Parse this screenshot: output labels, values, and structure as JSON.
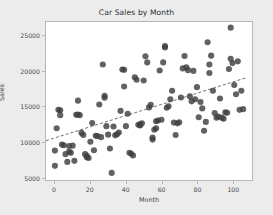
{
  "chart_data": {
    "type": "scatter",
    "title": "Car Sales by Month",
    "xlabel": "Month",
    "ylabel": "Sales",
    "xlim": [
      -5,
      111
    ],
    "ylim": [
      4600,
      26900
    ],
    "xticks": [
      0,
      20,
      40,
      60,
      80,
      100
    ],
    "yticks": [
      5000,
      10000,
      15000,
      20000,
      25000
    ],
    "xtick_labels": [
      "0",
      "20",
      "40",
      "60",
      "80",
      "100"
    ],
    "ytick_labels": [
      "5000",
      "10000",
      "15000",
      "20000",
      "25000"
    ],
    "grid": false,
    "legend": null,
    "marker_color": "#3f3f3f",
    "marker_size": 3.1,
    "background_color": "#ececed",
    "plot_background_color": "#ffffff",
    "frame_color": "#b6b6b8",
    "series": [
      {
        "name": "Sales",
        "points": [
          [
            0,
            6600
          ],
          [
            0,
            8750
          ],
          [
            1,
            11900
          ],
          [
            2,
            14500
          ],
          [
            3,
            14450
          ],
          [
            3,
            13750
          ],
          [
            4,
            9600
          ],
          [
            5,
            9500
          ],
          [
            6,
            8250
          ],
          [
            7,
            7150
          ],
          [
            8,
            9400
          ],
          [
            8,
            8600
          ],
          [
            9,
            8450
          ],
          [
            10,
            9450
          ],
          [
            11,
            7300
          ],
          [
            12,
            13800
          ],
          [
            13,
            13850
          ],
          [
            13,
            15800
          ],
          [
            14,
            13750
          ],
          [
            15,
            11250
          ],
          [
            16,
            10950
          ],
          [
            17,
            8250
          ],
          [
            18,
            7800
          ],
          [
            18,
            8000
          ],
          [
            19,
            7700
          ],
          [
            20,
            10000
          ],
          [
            21,
            12650
          ],
          [
            22,
            8800
          ],
          [
            23,
            10850
          ],
          [
            24,
            10800
          ],
          [
            25,
            15250
          ],
          [
            26,
            10650
          ],
          [
            27,
            20900
          ],
          [
            28,
            16200
          ],
          [
            28,
            16500
          ],
          [
            29,
            12200
          ],
          [
            30,
            11000
          ],
          [
            31,
            9050
          ],
          [
            32,
            5600
          ],
          [
            33,
            12150
          ],
          [
            34,
            10900
          ],
          [
            35,
            11050
          ],
          [
            36,
            11300
          ],
          [
            37,
            14350
          ],
          [
            38,
            20200
          ],
          [
            39,
            20150
          ],
          [
            39,
            17800
          ],
          [
            40,
            12200
          ],
          [
            41,
            13950
          ],
          [
            42,
            8450
          ],
          [
            43,
            8300
          ],
          [
            44,
            8050
          ],
          [
            45,
            19100
          ],
          [
            46,
            18750
          ],
          [
            47,
            12400
          ],
          [
            48,
            12450
          ],
          [
            48,
            12300
          ],
          [
            49,
            12600
          ],
          [
            50,
            18650
          ],
          [
            51,
            22050
          ],
          [
            52,
            21200
          ],
          [
            53,
            14850
          ],
          [
            54,
            15200
          ],
          [
            55,
            10300
          ],
          [
            55,
            10600
          ],
          [
            56,
            11700
          ],
          [
            57,
            11900
          ],
          [
            57,
            12900
          ],
          [
            58,
            13000
          ],
          [
            59,
            20050
          ],
          [
            60,
            13100
          ],
          [
            61,
            21200
          ],
          [
            62,
            23500
          ],
          [
            62,
            23300
          ],
          [
            63,
            14800
          ],
          [
            64,
            15000
          ],
          [
            65,
            16000
          ],
          [
            66,
            17200
          ],
          [
            67,
            12700
          ],
          [
            68,
            10950
          ],
          [
            69,
            12600
          ],
          [
            70,
            12750
          ],
          [
            71,
            16250
          ],
          [
            72,
            20350
          ],
          [
            73,
            22100
          ],
          [
            74,
            20500
          ],
          [
            75,
            20100
          ],
          [
            76,
            16400
          ],
          [
            77,
            15700
          ],
          [
            78,
            20000
          ],
          [
            79,
            16000
          ],
          [
            80,
            17700
          ],
          [
            81,
            13450
          ],
          [
            82,
            15600
          ],
          [
            83,
            14700
          ],
          [
            84,
            11550
          ],
          [
            85,
            12800
          ],
          [
            86,
            24050
          ],
          [
            87,
            19700
          ],
          [
            87,
            20900
          ],
          [
            88,
            22150
          ],
          [
            89,
            17200
          ],
          [
            90,
            14050
          ],
          [
            91,
            13400
          ],
          [
            92,
            13550
          ],
          [
            93,
            16100
          ],
          [
            94,
            13400
          ],
          [
            95,
            13250
          ],
          [
            96,
            14150
          ],
          [
            97,
            14100
          ],
          [
            98,
            20250
          ],
          [
            99,
            21700
          ],
          [
            99,
            26100
          ],
          [
            100,
            21100
          ],
          [
            101,
            18000
          ],
          [
            102,
            16700
          ],
          [
            103,
            21350
          ],
          [
            104,
            14500
          ],
          [
            105,
            17200
          ],
          [
            106,
            14600
          ]
        ]
      }
    ],
    "trendline": {
      "style": "dashed",
      "color": "#5a5a5a",
      "x_start": -5,
      "y_start": 10150,
      "x_end": 108,
      "y_end": 19050
    }
  }
}
